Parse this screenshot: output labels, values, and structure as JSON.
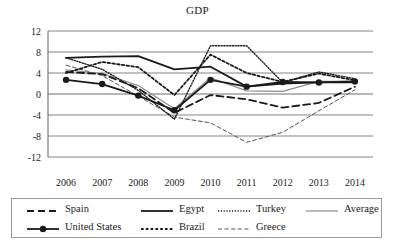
{
  "chart_data": {
    "type": "line",
    "title": "GDP",
    "xlabel": "",
    "ylabel": "",
    "x": [
      2006,
      2007,
      2008,
      2009,
      2010,
      2011,
      2012,
      2013,
      2014
    ],
    "categories": [
      "2006",
      "2007",
      "2008",
      "2009",
      "2010",
      "2011",
      "2012",
      "2013",
      "2014"
    ],
    "ylim": [
      -12,
      12
    ],
    "yticks": [
      12,
      8,
      4,
      0,
      -4,
      -8,
      -12
    ],
    "ytick_labels": [
      "12",
      "8",
      "4",
      "0",
      "-4",
      "-8",
      "-12"
    ],
    "grid": true,
    "legend_position": "bottom",
    "series": [
      {
        "name": "Spain",
        "style": "dashed",
        "color": "#1a1a1a",
        "width": 1.8,
        "values": [
          4.2,
          3.8,
          1.1,
          -3.6,
          -0.2,
          -1.0,
          -2.6,
          -1.7,
          1.4
        ]
      },
      {
        "name": "United States",
        "style": "solid-marker",
        "color": "#1a1a1a",
        "width": 1.8,
        "values": [
          2.7,
          1.9,
          -0.3,
          -3.1,
          2.7,
          1.4,
          2.3,
          2.2,
          2.4
        ]
      },
      {
        "name": "Egypt",
        "style": "solid",
        "color": "#1a1a1a",
        "width": 1.8,
        "values": [
          6.9,
          7.1,
          7.2,
          4.7,
          5.2,
          1.4,
          2.0,
          2.2,
          2.2
        ]
      },
      {
        "name": "Brazil",
        "style": "dotted",
        "color": "#1a1a1a",
        "width": 1.8,
        "values": [
          4.0,
          6.1,
          5.1,
          -0.2,
          7.5,
          4.0,
          2.3,
          3.9,
          2.6
        ]
      },
      {
        "name": "Turkey",
        "style": "fine-dotted",
        "color": "#1a1a1a",
        "width": 1.4,
        "values": [
          6.9,
          4.7,
          0.7,
          -4.8,
          9.2,
          9.2,
          2.2,
          4.2,
          2.9
        ]
      },
      {
        "name": "Greece",
        "style": "fine-dashed",
        "color": "#555555",
        "width": 1.0,
        "values": [
          5.5,
          3.5,
          -0.4,
          -4.4,
          -5.5,
          -9.2,
          -7.3,
          -3.2,
          0.8
        ]
      },
      {
        "name": "Average",
        "style": "solid",
        "color": "#8c8c8c",
        "width": 1.2,
        "values": [
          4.6,
          3.9,
          1.6,
          -2.8,
          3.1,
          0.6,
          0.5,
          2.4,
          2.4
        ]
      }
    ]
  },
  "chart": {
    "title": "GDP"
  },
  "legend": {
    "items": [
      {
        "label": "Spain"
      },
      {
        "label": "Egypt"
      },
      {
        "label": "Turkey"
      },
      {
        "label": "Average"
      },
      {
        "label": "United States"
      },
      {
        "label": "Brazil"
      },
      {
        "label": "Greece"
      }
    ]
  },
  "colors": {
    "axis": "#6f6f6f",
    "grid": "#777777",
    "ink": "#1a1a1a",
    "average": "#8c8c8c",
    "greece": "#555555",
    "background": "#ffffff"
  }
}
